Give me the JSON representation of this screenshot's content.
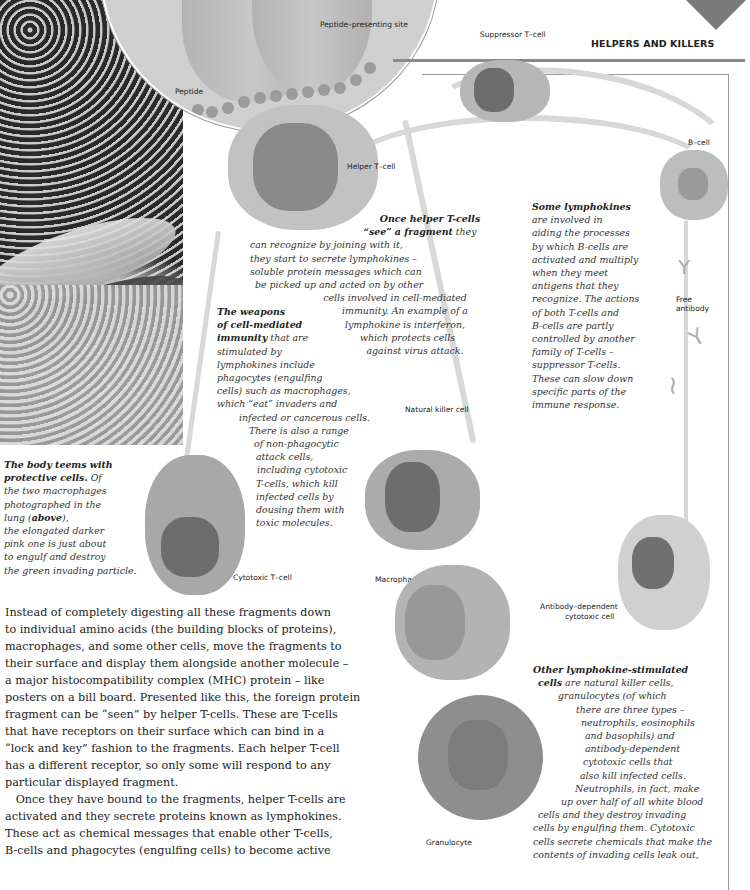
{
  "header": {
    "section_title": "HELPERS AND KILLERS"
  },
  "diagram_labels": {
    "peptide": "Peptide",
    "peptide_presenting_site": "Peptide–presenting site",
    "suppressor_t_cell": "Suppressor T–cell",
    "helper_t_cell": "Helper T–cell",
    "b_cell": "B–cell",
    "free_antibody_1": "Free",
    "free_antibody_2": "antibody",
    "natural_killer_cell": "Natural killer cell",
    "cytotoxic_t_cell": "Cytotoxic T–cell",
    "macrophage": "Macrophage",
    "antibody_dependent_1": "Antibody–dependent",
    "antibody_dependent_2": "cytotoxic cell",
    "granulocyte": "Granulocyte"
  },
  "captions": {
    "helper": {
      "lead_1": "Once helper T-cells",
      "lead_2": "“see” a fragment",
      "lines": [
        "they",
        "can recognize by joining with it,",
        "they start to secrete lymphokines –",
        "soluble protein messages which can",
        "be picked up and acted on by other",
        "cells involved in cell-mediated",
        "immunity. An example of a",
        "lymphokine is interferon,",
        "which protects cells",
        "against virus attack."
      ]
    },
    "weapons": {
      "lead_1": "The weapons",
      "lead_2": "of cell-mediated",
      "lead_3": "immunity",
      "lines": [
        "that are",
        "stimulated by",
        "lymphokines include",
        "phagocytes (engulfing",
        "cells) such as macrophages,",
        "which “eat” invaders and",
        "infected or cancerous cells.",
        "There is also a range",
        "of non-phagocytic",
        "attack cells,",
        "including cytotoxic",
        "T-cells, which kill",
        "infected cells by",
        "dousing them with",
        "toxic molecules."
      ]
    },
    "lymphokines": {
      "lead": "Some lymphokines",
      "lines": [
        "are involved in",
        "aiding the processes",
        "by which B-cells are",
        "activated and multiply",
        "when they meet",
        "antigens that they",
        "recognize. The actions",
        "of both T-cells and",
        "B-cells are partly",
        "controlled by another",
        "family of T-cells –",
        "suppressor T-cells.",
        "These can slow down",
        "specific parts of the",
        "immune response."
      ]
    },
    "body_teems": {
      "lead_1": "The body teems with",
      "lead_2": "protective cells.",
      "lines": [
        "Of",
        "the two macrophages",
        "photographed in the",
        "lung (",
        "above",
        "),",
        "the elongated darker",
        "pink one is just about",
        "to engulf and destroy",
        "the green invading particle."
      ]
    },
    "other": {
      "lead_1": "Other lymphokine-stimulated",
      "lead_2": "cells",
      "lines": [
        "are natural killer cells,",
        "granulocytes (of which",
        "there are three types –",
        "neutrophils, eosinophils",
        "and basophils) and",
        "antibody-dependent",
        "cytotoxic cells that",
        "also kill infected cells.",
        "Neutrophils, in fact, make",
        "up over half of all white blood",
        "cells and they destroy invading",
        "cells by engulfing them. Cytotoxic",
        "cells secrete chemicals that make the",
        "contents of invading cells leak out,"
      ]
    }
  },
  "body": {
    "paragraph_lines": [
      "Instead of completely digesting all these fragments down",
      "to individual amino acids (the building blocks of proteins),",
      "macrophages, and some other cells, move the fragments to",
      "their surface and display them alongside another molecule –",
      "a major histocompatibility complex (MHC) protein – like",
      "posters on a bill board. Presented like this, the foreign protein",
      "fragment can be “seen” by helper T-cells. These are T-cells",
      "that have receptors on their surface which can bind in a",
      "“lock and key” fashion to the fragments. Each helper T-cell",
      "has a different receptor, so only some will respond to any",
      "particular displayed fragment.",
      "   Once they have bound to the fragments, helper T-cells are",
      "activated and they secrete proteins known as lymphokines.",
      "These act as chemical messages that enable other T-cells,",
      "B-cells and phagocytes (engulfing cells) to become active"
    ]
  }
}
